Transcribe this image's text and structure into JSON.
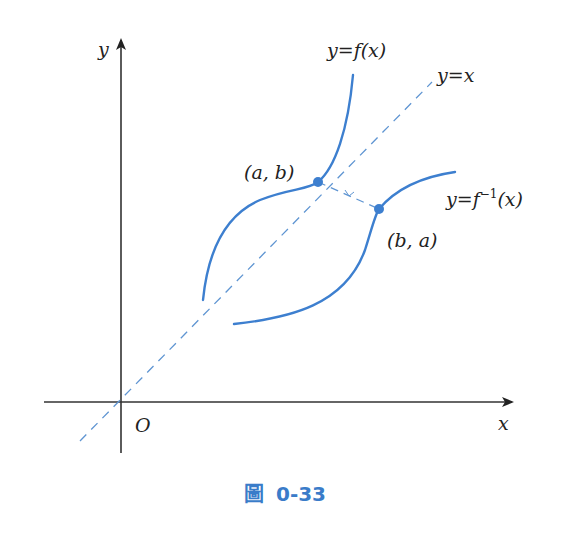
{
  "figure": {
    "colors": {
      "axis": "#333333",
      "curve": "#3d7fcf",
      "dashed": "#5f95d2",
      "caption": "#3a7cc9"
    },
    "axes": {
      "x_label": "x",
      "y_label": "y",
      "origin_label": "O"
    },
    "curves": {
      "f_label": "y=f(x)",
      "f_inverse_label_main": "y=f",
      "f_inverse_label_sup": "−1",
      "f_inverse_label_tail": "(x)",
      "identity_label": "y=x"
    },
    "points": {
      "p1_label": "(a, b)",
      "p2_label": "(b, a)"
    },
    "caption": {
      "prefix": "圖",
      "number": "0-33"
    }
  }
}
